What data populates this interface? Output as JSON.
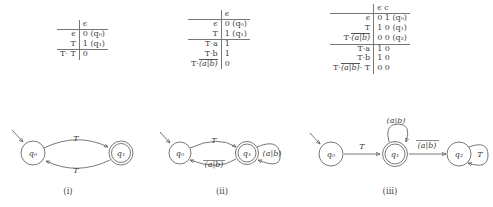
{
  "tables": [
    {
      "id": "table-1",
      "name": "derivative-table-1",
      "header": {
        "lhs": "",
        "rhs": "ϵ"
      },
      "rows": [
        {
          "lhs": "ϵ",
          "rhs": "0 (q₀)"
        },
        {
          "lhs": "T",
          "rhs": "1 (q₁)"
        }
      ],
      "footer_rows": [
        {
          "lhs": "T· T",
          "rhs": "0"
        }
      ]
    },
    {
      "id": "table-2",
      "name": "derivative-table-2",
      "header": {
        "lhs": "",
        "rhs": "ϵ"
      },
      "rows": [
        {
          "lhs": "ϵ",
          "rhs": "0 (q₀)"
        },
        {
          "lhs": "T",
          "rhs": "1 (q₁)"
        }
      ],
      "footer_rows": [
        {
          "lhs": "T·a",
          "rhs": "1"
        },
        {
          "lhs": "T·b",
          "rhs": "1"
        },
        {
          "lhs": "T·(a|b)",
          "rhs": "0",
          "lhs_overline": "(a|b)",
          "lhs_prefix": "T·"
        }
      ]
    },
    {
      "id": "table-3",
      "name": "derivative-table-3",
      "header": {
        "lhs": "",
        "rhs": "ϵ c"
      },
      "rows": [
        {
          "lhs": "ϵ",
          "rhs": "0 1 (q₀)"
        },
        {
          "lhs": "T",
          "rhs": "1 0 (q₁)"
        },
        {
          "lhs": "T·(a|b)",
          "rhs": "0 0 (q₂)",
          "lhs_overline": "(a|b)",
          "lhs_prefix": "T·"
        }
      ],
      "footer_rows": [
        {
          "lhs": "T·a",
          "rhs": "1 0"
        },
        {
          "lhs": "T·b",
          "rhs": "1 0"
        },
        {
          "lhs": "T·(a|b)· T",
          "rhs": "0 0",
          "lhs_overline": "(a|b)",
          "lhs_prefix": "T·",
          "lhs_suffix": "· T"
        }
      ]
    }
  ],
  "automata": [
    {
      "id": "automaton-1",
      "caption": "(i)",
      "states": [
        {
          "label": "q₀",
          "accepting": false,
          "start": true
        },
        {
          "label": "q₁",
          "accepting": true,
          "start": false
        }
      ],
      "edges": [
        {
          "from": "q₀",
          "to": "q₁",
          "label": "T"
        },
        {
          "from": "q₁",
          "to": "q₀",
          "label": "T"
        }
      ]
    },
    {
      "id": "automaton-2",
      "caption": "(ii)",
      "states": [
        {
          "label": "q₀",
          "accepting": false,
          "start": true
        },
        {
          "label": "q₁",
          "accepting": true,
          "start": false
        }
      ],
      "edges": [
        {
          "from": "q₀",
          "to": "q₁",
          "label": "T"
        },
        {
          "from": "q₁",
          "to": "q₀",
          "label": "(a|b)",
          "overline": true
        },
        {
          "from": "q₁",
          "to": "q₁",
          "label": "(a|b)",
          "selfloop": true
        }
      ]
    },
    {
      "id": "automaton-3",
      "caption": "(iii)",
      "states": [
        {
          "label": "q₀",
          "accepting": false,
          "start": true
        },
        {
          "label": "q₁",
          "accepting": true,
          "start": false
        },
        {
          "label": "q₂",
          "accepting": false,
          "start": false
        }
      ],
      "edges": [
        {
          "from": "q₀",
          "to": "q₁",
          "label": "T"
        },
        {
          "from": "q₁",
          "to": "q₁",
          "label": "(a|b)",
          "selfloop": true
        },
        {
          "from": "q₁",
          "to": "q₂",
          "label": "(a|b)",
          "overline": true
        },
        {
          "from": "q₂",
          "to": "q₂",
          "label": "T",
          "selfloop": true
        }
      ]
    }
  ],
  "labels": {
    "epsilon": "ϵ",
    "c": "c",
    "T": "T",
    "a": "a",
    "b": "b",
    "alt_ab": "(a|b)",
    "q0": "q₀",
    "q1": "q₁",
    "q2": "q₂"
  }
}
